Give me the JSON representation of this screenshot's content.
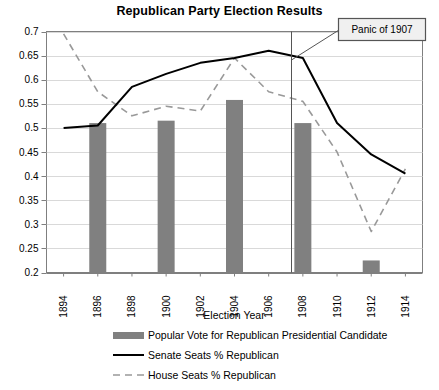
{
  "chart_data": {
    "type": "line",
    "title": "Republican Party Election Results",
    "xlabel": "Election Year",
    "ylabel": "",
    "grid": true,
    "legend_position": "bottom",
    "x": [
      1894,
      1896,
      1898,
      1900,
      1902,
      1904,
      1906,
      1908,
      1910,
      1912,
      1914
    ],
    "categories": [
      "1894",
      "1896",
      "1898",
      "1900",
      "1902",
      "1904",
      "1906",
      "1908",
      "1910",
      "1912",
      "1914"
    ],
    "xlim": [
      1893,
      1915
    ],
    "ylim": [
      0.2,
      0.7
    ],
    "yticks": [
      0.2,
      0.25,
      0.3,
      0.35,
      0.4,
      0.45,
      0.5,
      0.55,
      0.6,
      0.65,
      0.7
    ],
    "ytick_labels": [
      "0.2",
      "0.25",
      "0.3",
      "0.35",
      "0.4",
      "0.45",
      "0.5",
      "0.55",
      "0.6",
      "0.65",
      "0.7"
    ],
    "series": [
      {
        "name": "Popular Vote for Republican Presidential Candidate",
        "type": "bar",
        "color": "#808080",
        "x": [
          1896,
          1900,
          1904,
          1908,
          1912
        ],
        "values": [
          0.51,
          0.515,
          0.558,
          0.51,
          0.225
        ]
      },
      {
        "name": "Senate Seats % Republican",
        "type": "line",
        "style": "solid",
        "color": "#000000",
        "values": [
          0.5,
          0.505,
          0.585,
          0.612,
          0.635,
          0.645,
          0.66,
          0.645,
          0.51,
          0.445,
          0.405
        ]
      },
      {
        "name": "House Seats % Republican",
        "type": "line",
        "style": "dashed",
        "color": "#999999",
        "values": [
          0.695,
          0.575,
          0.525,
          0.545,
          0.535,
          0.645,
          0.575,
          0.555,
          0.45,
          0.285,
          0.415
        ]
      }
    ],
    "annotations": [
      {
        "label": "Panic of 1907",
        "marker_x": 1907,
        "type": "vertical-line-callout"
      }
    ]
  },
  "legend": {
    "items": [
      {
        "label": "Popular Vote for Republican Presidential Candidate",
        "marker": "bar-swatch"
      },
      {
        "label": "Senate Seats % Republican",
        "marker": "solid-line"
      },
      {
        "label": "House Seats % Republican",
        "marker": "dashed-line"
      }
    ]
  }
}
